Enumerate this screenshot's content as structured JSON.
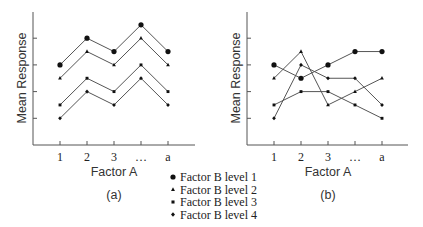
{
  "chart_data": [
    {
      "type": "line",
      "title": "(a)",
      "xlabel": "Factor A",
      "ylabel": "Mean Response",
      "categories": [
        "1",
        "2",
        "3",
        "…",
        "a"
      ],
      "ylim": [
        0,
        5
      ],
      "yticks": [
        1,
        2,
        3,
        4
      ],
      "ytick_labels": [
        "",
        "",
        "",
        ""
      ],
      "grid": false,
      "series": [
        {
          "name": "Factor B level 1",
          "marker": "circle",
          "values": [
            3.0,
            4.0,
            3.5,
            4.5,
            3.5
          ]
        },
        {
          "name": "Factor B level 2",
          "marker": "triangle",
          "values": [
            2.5,
            3.5,
            3.0,
            4.0,
            3.0
          ]
        },
        {
          "name": "Factor B level 3",
          "marker": "square",
          "values": [
            1.5,
            2.5,
            2.0,
            3.0,
            2.0
          ]
        },
        {
          "name": "Factor B level 4",
          "marker": "diamond",
          "values": [
            1.0,
            2.0,
            1.5,
            2.5,
            1.5
          ]
        }
      ]
    },
    {
      "type": "line",
      "title": "(b)",
      "xlabel": "Factor A",
      "ylabel": "Mean Response",
      "categories": [
        "1",
        "2",
        "3",
        "…",
        "a"
      ],
      "ylim": [
        0,
        5
      ],
      "yticks": [
        1,
        2,
        3,
        4
      ],
      "ytick_labels": [
        "",
        "",
        "",
        ""
      ],
      "grid": false,
      "series": [
        {
          "name": "Factor B level 1",
          "marker": "circle",
          "values": [
            3.0,
            2.5,
            3.0,
            3.5,
            3.5
          ]
        },
        {
          "name": "Factor B level 2",
          "marker": "triangle",
          "values": [
            2.5,
            3.5,
            1.5,
            2.0,
            2.5
          ]
        },
        {
          "name": "Factor B level 3",
          "marker": "square",
          "values": [
            1.5,
            2.0,
            2.0,
            1.5,
            1.0
          ]
        },
        {
          "name": "Factor B level 4",
          "marker": "diamond",
          "values": [
            1.0,
            3.0,
            2.5,
            2.5,
            1.5
          ]
        }
      ]
    }
  ],
  "panels": {
    "a": {
      "label": "(a)",
      "xlabel": "Factor A",
      "ylabel": "Mean Response",
      "xticks": [
        "1",
        "2",
        "3",
        "…",
        "a"
      ]
    },
    "b": {
      "label": "(b)",
      "xlabel": "Factor A",
      "ylabel": "Mean Response",
      "xticks": [
        "1",
        "2",
        "3",
        "…",
        "a"
      ]
    }
  },
  "legend": {
    "position": "bottom-center",
    "items": [
      {
        "label": "Factor B level 1",
        "marker": "circle"
      },
      {
        "label": "Factor B level 2",
        "marker": "triangle"
      },
      {
        "label": "Factor B level 3",
        "marker": "square"
      },
      {
        "label": "Factor B level 4",
        "marker": "diamond"
      }
    ]
  },
  "colors": {
    "line": "#555555",
    "marker": "#111111",
    "text": "#222222"
  }
}
